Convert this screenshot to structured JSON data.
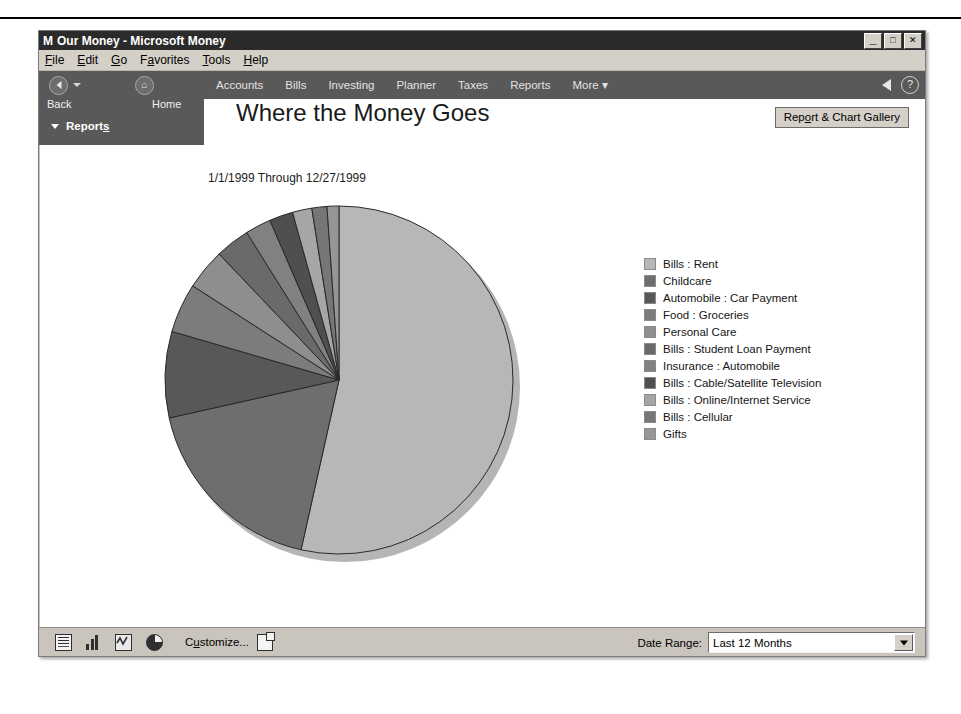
{
  "window": {
    "logo": "M",
    "title": "Our Money - Microsoft Money",
    "minimize_label": "_",
    "maximize_label": "□",
    "close_label": "✕"
  },
  "menubar": {
    "items": [
      {
        "pre": "",
        "accel": "F",
        "post": "ile"
      },
      {
        "pre": "",
        "accel": "E",
        "post": "dit"
      },
      {
        "pre": "",
        "accel": "G",
        "post": "o"
      },
      {
        "pre": "F",
        "accel": "a",
        "post": "vorites"
      },
      {
        "pre": "",
        "accel": "T",
        "post": "ools"
      },
      {
        "pre": "",
        "accel": "H",
        "post": "elp"
      }
    ]
  },
  "nav": {
    "back_label": "Back",
    "home_label": "Home",
    "tabs": [
      {
        "label": "Accounts"
      },
      {
        "label": "Bills"
      },
      {
        "label": "Investing"
      },
      {
        "label": "Planner"
      },
      {
        "label": "Taxes"
      },
      {
        "label": "Reports"
      },
      {
        "label": "More ▾"
      }
    ],
    "help_label": "?"
  },
  "sidebar": {
    "reports_pre": "Report",
    "reports_accel": "s",
    "reports_post": ""
  },
  "report": {
    "title": "Where the Money Goes",
    "subtitle": "1/1/1999 Through 12/27/1999",
    "gallery_pre": "Rep",
    "gallery_accel": "o",
    "gallery_post": "rt & Chart Gallery"
  },
  "bottom": {
    "customize_pre": "C",
    "customize_accel": "u",
    "customize_post": "stomize...",
    "date_range_label": "Date Range:",
    "date_range_value": "Last 12 Months"
  },
  "chart_data": {
    "type": "pie",
    "title": "Where the Money Goes",
    "subtitle": "1/1/1999 Through 12/27/1999",
    "legend_position": "right",
    "start_angle_deg": 0,
    "direction": "clockwise",
    "categories": [
      "Bills : Rent",
      "Childcare",
      "Automobile : Car Payment",
      "Food : Groceries",
      "Personal Care",
      "Bills : Student Loan Payment",
      "Insurance : Automobile",
      "Bills : Cable/Satellite Television",
      "Bills : Online/Internet Service",
      "Bills : Cellular",
      "Gifts"
    ],
    "values": [
      53.5,
      18.0,
      8.0,
      4.6,
      3.8,
      3.2,
      2.4,
      2.2,
      1.8,
      1.4,
      1.1
    ],
    "unit": "percent",
    "colors": [
      "#b7b7b7",
      "#6e6e6e",
      "#585858",
      "#7c7c7c",
      "#8e8e8e",
      "#6a6a6a",
      "#818181",
      "#4f4f4f",
      "#a6a6a6",
      "#767676",
      "#969696"
    ]
  }
}
